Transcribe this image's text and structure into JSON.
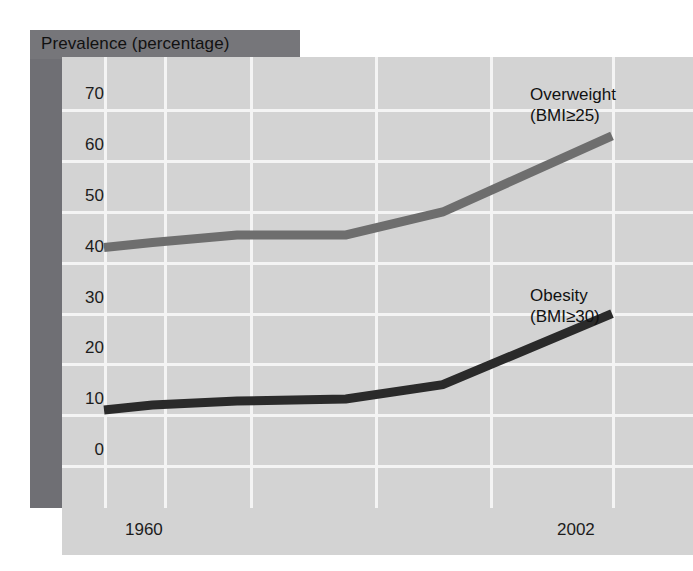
{
  "title": "Prevalence (percentage)",
  "colors": {
    "panel_background": "#d3d3d3",
    "shadow_panel": "#76767a",
    "gridline": "#f4f4f4",
    "overweight_line": "#6e6e6e",
    "obesity_line": "#2a2a2a",
    "text": "#1c1c1c"
  },
  "labels": {
    "overweight_name": "Overweight",
    "overweight_criteria": "(BMI≥25)",
    "obesity_name": "Obesity",
    "obesity_criteria": "(BMI≥30)"
  },
  "chart_data": {
    "type": "line",
    "title": "Prevalence (percentage)",
    "xlabel": "",
    "ylabel": "Prevalence (percentage)",
    "ylim": [
      0,
      75
    ],
    "xlim": [
      1960,
      2002
    ],
    "grid": true,
    "legend": "inline-annotations",
    "yticks": [
      0,
      10,
      20,
      30,
      40,
      50,
      60,
      70
    ],
    "ytick_labels": [
      "0",
      "10",
      "20",
      "30",
      "40",
      "50",
      "60",
      "70"
    ],
    "xticks": [
      1960,
      2002
    ],
    "xtick_labels": [
      "1960",
      "2002"
    ],
    "x": [
      1960,
      1964,
      1971,
      1980,
      1988,
      2002
    ],
    "series": [
      {
        "name": "Overweight",
        "criteria": "(BMI≥25)",
        "color": "#6e6e6e",
        "values": [
          43,
          44,
          45.5,
          45.5,
          50,
          65
        ]
      },
      {
        "name": "Obesity",
        "criteria": "(BMI≥30)",
        "color": "#2a2a2a",
        "values": [
          11,
          12,
          12.8,
          13.2,
          16,
          30
        ]
      }
    ]
  }
}
